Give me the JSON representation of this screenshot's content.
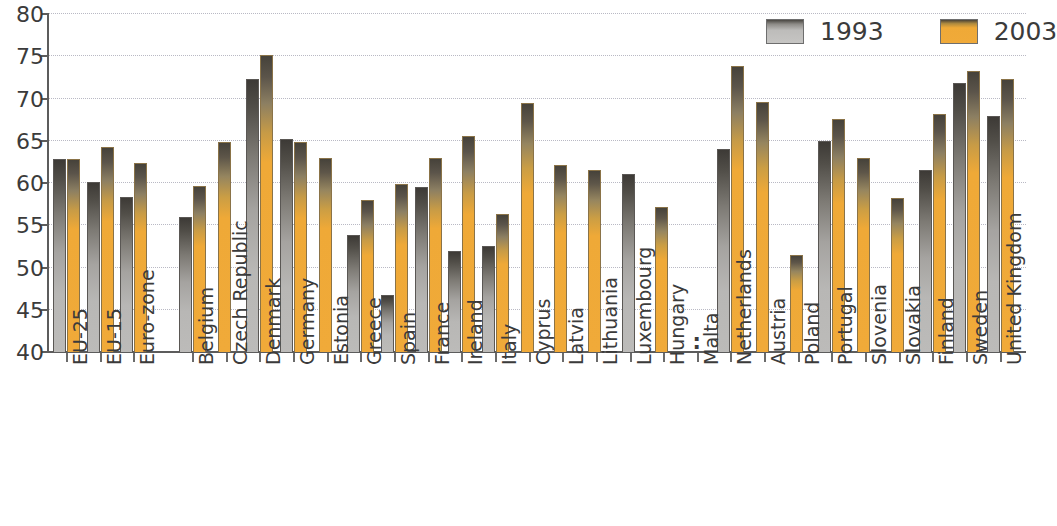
{
  "chart_data": {
    "type": "bar",
    "title": "",
    "subtitle": "",
    "xlabel": "",
    "ylabel": "",
    "ylim": [
      40,
      80
    ],
    "ytick_step": 5,
    "yticks": [
      40,
      45,
      50,
      55,
      60,
      65,
      70,
      75,
      80
    ],
    "grid": "horizontal-dotted",
    "legend_position": "top-right",
    "no_data_symbol": ":",
    "categories": [
      "EU-25",
      "EU-15",
      "Euro-zone",
      "Belgium",
      "Czech Republic",
      "Denmark",
      "Germany",
      "Estonia",
      "Greece",
      "Spain",
      "France",
      "Ireland",
      "Italy",
      "Cyprus",
      "Latvia",
      "Lithuania",
      "Luxembourg",
      "Hungary",
      "Malta",
      "Netherlands",
      "Austria",
      "Poland",
      "Portugal",
      "Slovenia",
      "Slovakia",
      "Finland",
      "Sweden",
      "United Kingdom"
    ],
    "series": [
      {
        "name": "1993",
        "color": "#b8b7b5",
        "values": [
          62.9,
          60.1,
          58.3,
          56.0,
          null,
          72.3,
          65.2,
          null,
          53.9,
          46.7,
          59.5,
          51.9,
          52.6,
          null,
          null,
          null,
          61.1,
          null,
          null,
          64.0,
          null,
          null,
          65.0,
          null,
          null,
          61.5,
          71.8,
          67.9
        ]
      },
      {
        "name": "2003",
        "color": "#f0aa39",
        "values": [
          62.9,
          64.3,
          62.4,
          59.7,
          64.8,
          75.2,
          64.8,
          63.0,
          58.0,
          59.9,
          63.0,
          65.6,
          56.3,
          69.5,
          62.1,
          61.5,
          null,
          57.2,
          null,
          73.9,
          69.6,
          51.5,
          67.6,
          63.0,
          58.2,
          68.2,
          73.3,
          72.3
        ]
      }
    ],
    "group_gaps_after": [
      "Euro-zone"
    ],
    "legend": [
      {
        "label": "1993",
        "swatch": "gray-gradient"
      },
      {
        "label": "2003",
        "swatch": "orange-gradient"
      }
    ]
  }
}
